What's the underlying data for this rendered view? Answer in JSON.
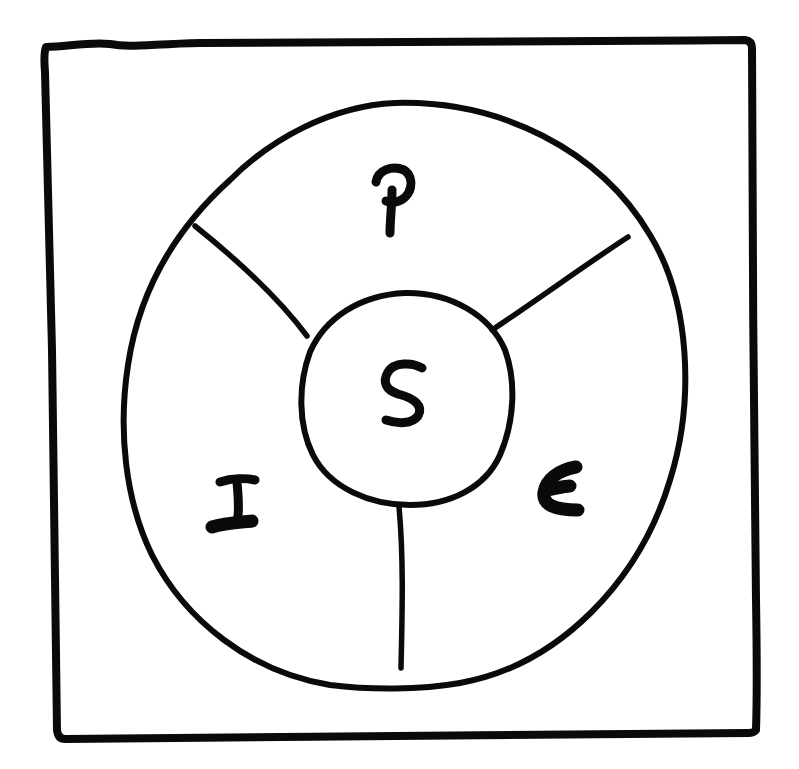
{
  "diagram": {
    "type": "hand-drawn concentric circle diagram",
    "background": "#ffffff",
    "ink_color": "#0a0a0a",
    "frame": {
      "shape": "square",
      "corners": {
        "top_left": [
          43,
          46
        ],
        "top_right": [
          752,
          42
        ],
        "bottom_right": [
          757,
          732
        ],
        "bottom_left": [
          58,
          740
        ]
      }
    },
    "outer_circle": {
      "center": [
        405,
        395
      ],
      "extent": {
        "left": 124,
        "right": 688,
        "top": 102,
        "bottom": 688
      }
    },
    "inner_circle": {
      "center": [
        407,
        398
      ],
      "extent": {
        "left": 302,
        "right": 513,
        "top": 292,
        "bottom": 505
      },
      "label": "S"
    },
    "segments": [
      {
        "id": "top",
        "label": "P",
        "label_position": [
          390,
          200
        ]
      },
      {
        "id": "bottom-left",
        "label": "I",
        "label_position": [
          235,
          505
        ]
      },
      {
        "id": "bottom-right",
        "label": "E",
        "label_position": [
          565,
          490
        ]
      }
    ],
    "spokes": [
      {
        "id": "upper-left",
        "from": [
          306,
          336
        ],
        "to": [
          193,
          226
        ]
      },
      {
        "id": "upper-right",
        "from": [
          492,
          330
        ],
        "to": [
          627,
          237
        ]
      },
      {
        "id": "bottom",
        "from": [
          400,
          505
        ],
        "to": [
          401,
          668
        ]
      }
    ]
  }
}
